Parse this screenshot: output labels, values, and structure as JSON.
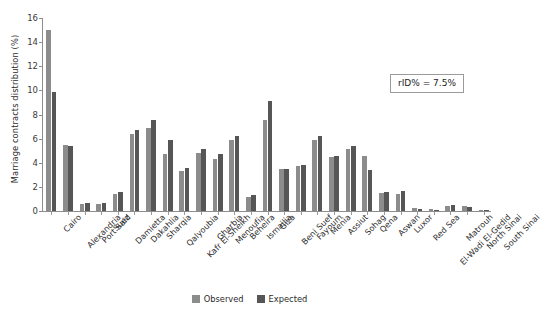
{
  "chart_data": {
    "type": "bar",
    "title": "",
    "xlabel": "",
    "ylabel": "Marriage contracts distribution (%)",
    "ylim": [
      0,
      16
    ],
    "yticks": [
      0,
      2,
      4,
      6,
      8,
      10,
      12,
      14,
      16
    ],
    "grid": false,
    "legend_position": "bottom-center",
    "annotation": "rID% = 7.5%",
    "categories": [
      "Cairo",
      "Alexandria",
      "Port Said",
      "Suez",
      "Damietta",
      "Dakahlia",
      "Sharqia",
      "Qalyoubia",
      "Kafr El-Sheikh",
      "Gharbia",
      "Menoufia",
      "Beheira",
      "Ismailia",
      "Giza",
      "Beni Suef",
      "Fayoum",
      "Menia",
      "Assiut",
      "Sohag",
      "Qena",
      "Aswan",
      "Luxor",
      "Red Sea",
      "El-Wadi El-Gedid",
      "Matrouh",
      "North Sinai",
      "South Sinai"
    ],
    "series": [
      {
        "name": "Observed",
        "color": "#8c8c8c",
        "values": [
          15.0,
          5.5,
          0.55,
          0.6,
          1.4,
          6.4,
          6.9,
          4.7,
          3.3,
          4.8,
          4.3,
          5.9,
          1.15,
          7.55,
          3.5,
          3.75,
          5.9,
          4.45,
          5.15,
          4.6,
          1.5,
          1.45,
          0.25,
          0.15,
          0.45,
          0.4,
          0.08
        ]
      },
      {
        "name": "Expected",
        "color": "#565656",
        "values": [
          9.9,
          5.35,
          0.65,
          0.7,
          1.6,
          6.75,
          7.55,
          5.85,
          3.6,
          5.15,
          4.7,
          6.25,
          1.3,
          9.1,
          3.45,
          3.8,
          6.25,
          4.6,
          5.35,
          3.4,
          1.6,
          1.7,
          0.2,
          0.1,
          0.5,
          0.35,
          0.06
        ]
      }
    ]
  },
  "legend": {
    "items": [
      {
        "label": "Observed"
      },
      {
        "label": "Expected"
      }
    ]
  }
}
